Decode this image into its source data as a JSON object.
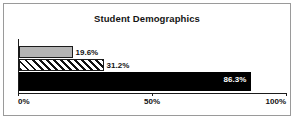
{
  "chart_data": {
    "type": "bar",
    "orientation": "horizontal",
    "title": "Student Demographics",
    "xlabel": "",
    "ylabel": "",
    "categories": [
      "",
      "",
      ""
    ],
    "values": [
      19.6,
      31.2,
      86.3
    ],
    "value_labels": [
      "19.6%",
      "31.2%",
      "86.3%"
    ],
    "series": [
      {
        "name": "",
        "values": [
          19.6,
          31.2,
          86.3
        ]
      }
    ],
    "bars": [
      {
        "value": 19.6,
        "label": "19.6%",
        "fill": "solid-gray",
        "label_position": "outside"
      },
      {
        "value": 31.2,
        "label": "31.2%",
        "fill": "hatched",
        "label_position": "outside"
      },
      {
        "value": 86.3,
        "label": "86.3%",
        "fill": "solid-black",
        "label_position": "inside"
      }
    ],
    "xlim": [
      0,
      100
    ],
    "x_ticks": [
      0,
      50,
      100
    ],
    "x_tick_labels": [
      "0%",
      "50%",
      "100%"
    ],
    "grid": false,
    "legend": false,
    "colors": {
      "bar_gray": "#b4b4b4",
      "bar_black": "#000000",
      "hatch": "#111111",
      "axis": "#1b1b1b",
      "text": "#121212",
      "inside_label_text": "#ffffff",
      "frame_border": "#9a9a9a",
      "background": "#ffffff"
    }
  }
}
